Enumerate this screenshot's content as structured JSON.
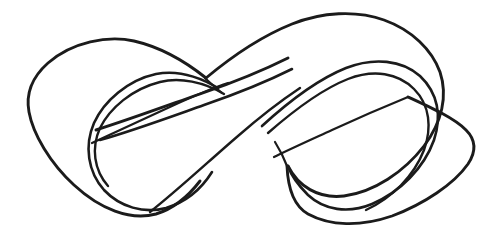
{
  "figure": {
    "style": "hand-drawn black ink contour sketch on white background",
    "background_color": "#ffffff",
    "ink_color": "#1b1b1b",
    "stroke_width_px": 2.6,
    "canvas": {
      "width": 502,
      "height": 242
    },
    "caption": ""
  },
  "geometry": {
    "description": "Figure-eight shaped band with a single half twist; left lobe and right lobe cross near the center of the canvas.",
    "left_lobe": {
      "name": "left-lobe",
      "leftmost_point": [
        28,
        105
      ],
      "top_point": [
        110,
        41
      ],
      "bottom_point": [
        150,
        212
      ],
      "inner_hole_junction": [
        92,
        143
      ]
    },
    "right_lobe": {
      "name": "right-lobe",
      "rightmost_point": [
        472,
        130
      ],
      "top_point": [
        340,
        14
      ],
      "bottom_point": [
        370,
        196
      ],
      "inner_hole_junction": [
        408,
        97
      ]
    },
    "crossings": [
      {
        "name": "upper-center-crossing",
        "point": [
          205,
          78
        ]
      },
      {
        "name": "center-crossing",
        "point": [
          262,
          125
        ]
      },
      {
        "name": "lower-center-crossing",
        "point": [
          287,
          166
        ]
      }
    ]
  }
}
